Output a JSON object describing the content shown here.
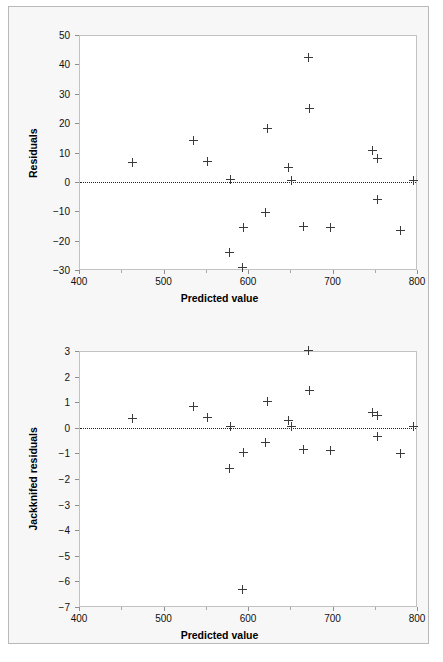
{
  "figure": {
    "background_color": "#f7f7f7",
    "plot_background_color": "#ffffff",
    "marker_color": "#3a3a3a",
    "axis_color": "#8e8e8e",
    "zero_line_style": "dotted"
  },
  "chart_data": [
    {
      "type": "scatter",
      "id": "residuals-vs-predicted",
      "title": "",
      "xlabel": "Predicted value",
      "ylabel": "Residuals",
      "xlim": [
        400,
        800
      ],
      "ylim": [
        -30,
        50
      ],
      "xticks": [
        400,
        500,
        600,
        700,
        800
      ],
      "yticks": [
        -30,
        -20,
        -10,
        0,
        10,
        20,
        30,
        40,
        50
      ],
      "xtick_labels": [
        "400",
        "500",
        "600",
        "700",
        "800"
      ],
      "ytick_labels": [
        "-30",
        "-20",
        "-10",
        "0",
        "10",
        "20",
        "30",
        "40",
        "50"
      ],
      "grid": false,
      "legend": false,
      "reference_line": {
        "orientation": "horizontal",
        "value": 0,
        "style": "dotted"
      },
      "marker_symbol": "plus",
      "points": [
        {
          "x": 462,
          "y": 6.8
        },
        {
          "x": 534,
          "y": 14.5
        },
        {
          "x": 551,
          "y": 7.3
        },
        {
          "x": 578,
          "y": 1.2
        },
        {
          "x": 577,
          "y": -23.6
        },
        {
          "x": 592,
          "y": -28.8
        },
        {
          "x": 593,
          "y": -15.3
        },
        {
          "x": 620,
          "y": -10.2
        },
        {
          "x": 622,
          "y": 18.6
        },
        {
          "x": 647,
          "y": 5.4
        },
        {
          "x": 650,
          "y": 0.7
        },
        {
          "x": 665,
          "y": -14.7
        },
        {
          "x": 671,
          "y": 42.6
        },
        {
          "x": 672,
          "y": 25.4
        },
        {
          "x": 697,
          "y": -15.3
        },
        {
          "x": 746,
          "y": 11.1
        },
        {
          "x": 752,
          "y": 8.4
        },
        {
          "x": 752,
          "y": -5.6
        },
        {
          "x": 779,
          "y": -16.1
        },
        {
          "x": 795,
          "y": 0.9
        }
      ]
    },
    {
      "type": "scatter",
      "id": "jackknifed-residuals-vs-predicted",
      "title": "",
      "xlabel": "Predicted value",
      "ylabel": "Jackknifed residuals",
      "xlim": [
        400,
        800
      ],
      "ylim": [
        -7,
        3
      ],
      "xticks": [
        400,
        500,
        600,
        700,
        800
      ],
      "yticks": [
        -7,
        -6,
        -5,
        -4,
        -3,
        -2,
        -1,
        0,
        1,
        2,
        3
      ],
      "xtick_labels": [
        "400",
        "500",
        "600",
        "700",
        "800"
      ],
      "ytick_labels": [
        "-7",
        "-6",
        "-5",
        "-4",
        "-3",
        "-2",
        "-1",
        "0",
        "1",
        "2",
        "3"
      ],
      "grid": false,
      "legend": false,
      "reference_line": {
        "orientation": "horizontal",
        "value": 0,
        "style": "dotted"
      },
      "marker_symbol": "plus",
      "points": [
        {
          "x": 462,
          "y": 0.42
        },
        {
          "x": 534,
          "y": 0.88
        },
        {
          "x": 551,
          "y": 0.45
        },
        {
          "x": 578,
          "y": 0.08
        },
        {
          "x": 577,
          "y": -1.57
        },
        {
          "x": 592,
          "y": -6.28
        },
        {
          "x": 593,
          "y": -0.93
        },
        {
          "x": 620,
          "y": -0.55
        },
        {
          "x": 622,
          "y": 1.06
        },
        {
          "x": 647,
          "y": 0.33
        },
        {
          "x": 650,
          "y": 0.08
        },
        {
          "x": 665,
          "y": -0.79
        },
        {
          "x": 671,
          "y": 3.04
        },
        {
          "x": 672,
          "y": 1.5
        },
        {
          "x": 697,
          "y": -0.84
        },
        {
          "x": 746,
          "y": 0.63
        },
        {
          "x": 752,
          "y": 0.53
        },
        {
          "x": 752,
          "y": -0.3
        },
        {
          "x": 779,
          "y": -0.95
        },
        {
          "x": 795,
          "y": 0.1
        }
      ]
    }
  ]
}
